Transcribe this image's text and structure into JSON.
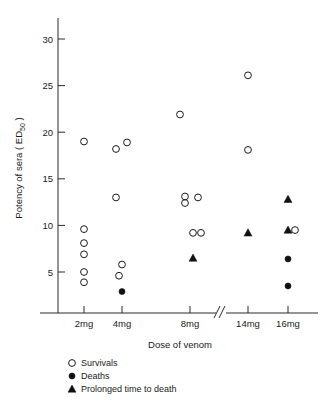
{
  "chart_data": {
    "type": "scatter",
    "title": "",
    "xlabel": "Dose of venom",
    "ylabel": "Potency of sera (ED50)",
    "ylabel_main": "Potency of sera ( ED",
    "ylabel_sub": "50",
    "ylabel_tail": " )",
    "categories": [
      "2mg",
      "4mg",
      "8mg",
      "14mg",
      "16mg"
    ],
    "xtick_labels": [
      "2mg",
      "4mg",
      "8mg",
      "14mg",
      "16mg"
    ],
    "ytick_labels": [
      "5",
      "10",
      "15",
      "20",
      "25",
      "30"
    ],
    "ytick_values": [
      5,
      10,
      15,
      20,
      25,
      30
    ],
    "ylim": [
      0,
      32
    ],
    "grid": false,
    "axis_break": {
      "present": true,
      "between": [
        "8mg",
        "14mg"
      ],
      "glyph": "//"
    },
    "legend": {
      "position": "below-axis-left",
      "entries": [
        {
          "marker": "open-circle",
          "label": "Survivals"
        },
        {
          "marker": "filled-circle",
          "label": "Deaths"
        },
        {
          "marker": "filled-triangle",
          "label": "Prolonged time to death"
        }
      ]
    },
    "series": [
      {
        "name": "Survivals",
        "marker": "open-circle",
        "points": [
          {
            "dose": "2mg",
            "x_offset": 0,
            "y": 19.0
          },
          {
            "dose": "2mg",
            "x_offset": 0,
            "y": 9.6
          },
          {
            "dose": "2mg",
            "x_offset": 0,
            "y": 8.1
          },
          {
            "dose": "2mg",
            "x_offset": 0,
            "y": 6.9
          },
          {
            "dose": "2mg",
            "x_offset": 0,
            "y": 5.0
          },
          {
            "dose": "2mg",
            "x_offset": 0,
            "y": 3.9
          },
          {
            "dose": "4mg",
            "x_offset": -6,
            "y": 18.2
          },
          {
            "dose": "4mg",
            "x_offset": 5,
            "y": 18.9
          },
          {
            "dose": "4mg",
            "x_offset": -6,
            "y": 13.0
          },
          {
            "dose": "4mg",
            "x_offset": 0,
            "y": 5.8
          },
          {
            "dose": "4mg",
            "x_offset": -3,
            "y": 4.6
          },
          {
            "dose": "8mg",
            "x_offset": -10,
            "y": 21.9
          },
          {
            "dose": "8mg",
            "x_offset": -5,
            "y": 13.1
          },
          {
            "dose": "8mg",
            "x_offset": -5,
            "y": 12.4
          },
          {
            "dose": "8mg",
            "x_offset": 8,
            "y": 13.0
          },
          {
            "dose": "8mg",
            "x_offset": 3,
            "y": 9.2
          },
          {
            "dose": "8mg",
            "x_offset": 11,
            "y": 9.2
          },
          {
            "dose": "14mg",
            "x_offset": 0,
            "y": 26.1
          },
          {
            "dose": "14mg",
            "x_offset": 0,
            "y": 18.1
          },
          {
            "dose": "16mg",
            "x_offset": 7,
            "y": 9.5
          }
        ]
      },
      {
        "name": "Deaths",
        "marker": "filled-circle",
        "points": [
          {
            "dose": "4mg",
            "x_offset": 0,
            "y": 2.9
          },
          {
            "dose": "16mg",
            "x_offset": 0,
            "y": 6.4
          },
          {
            "dose": "16mg",
            "x_offset": 0,
            "y": 3.5
          }
        ]
      },
      {
        "name": "Prolonged time to death",
        "marker": "filled-triangle",
        "points": [
          {
            "dose": "8mg",
            "x_offset": 3,
            "y": 6.5
          },
          {
            "dose": "14mg",
            "x_offset": 0,
            "y": 9.2
          },
          {
            "dose": "16mg",
            "x_offset": 0,
            "y": 12.8
          },
          {
            "dose": "16mg",
            "x_offset": 0,
            "y": 9.5
          }
        ]
      }
    ]
  }
}
